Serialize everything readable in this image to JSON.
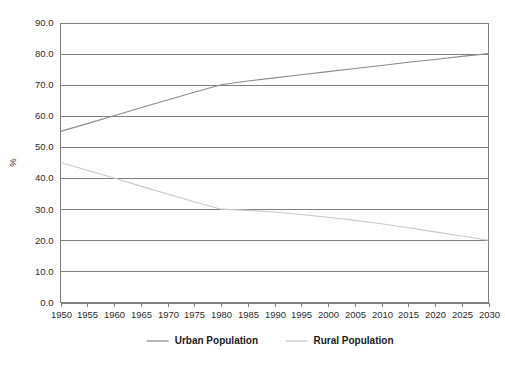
{
  "chart_data": {
    "type": "line",
    "title": "",
    "xlabel": "",
    "ylabel": "%",
    "xlim": [
      1950,
      2030
    ],
    "ylim": [
      0,
      90
    ],
    "ytick_step": 10,
    "ytick_labels": [
      "0.0",
      "10.0",
      "20.0",
      "30.0",
      "40.0",
      "50.0",
      "60.0",
      "70.0",
      "80.0",
      "90.0"
    ],
    "ytick_values": [
      0,
      10,
      20,
      30,
      40,
      50,
      60,
      70,
      80,
      90
    ],
    "xtick_labels": [
      "1950",
      "1955",
      "1960",
      "1965",
      "1970",
      "1975",
      "1980",
      "1985",
      "1990",
      "1995",
      "2000",
      "2005",
      "2010",
      "2015",
      "2020",
      "2025",
      "2030"
    ],
    "x": [
      1950,
      1955,
      1960,
      1965,
      1970,
      1975,
      1980,
      1985,
      1990,
      1995,
      2000,
      2005,
      2010,
      2015,
      2020,
      2025,
      2030
    ],
    "grid": "horizontal",
    "legend_position": "bottom-center",
    "series": [
      {
        "name": "Urban Population",
        "color": "#8c8c8c",
        "values": [
          55.0,
          57.5,
          60.0,
          62.6,
          65.1,
          67.6,
          70.0,
          71.2,
          72.2,
          73.2,
          74.2,
          75.2,
          76.2,
          77.2,
          78.1,
          79.1,
          80.0
        ]
      },
      {
        "name": "Rural Population",
        "color": "#c9c9c9",
        "values": [
          45.0,
          42.5,
          40.0,
          37.4,
          34.9,
          32.4,
          30.0,
          29.6,
          29.1,
          28.3,
          27.4,
          26.4,
          25.3,
          24.0,
          22.7,
          21.4,
          20.0
        ]
      }
    ]
  },
  "legend": {
    "entries": [
      {
        "label": "Urban Population",
        "color": "#8c8c8c"
      },
      {
        "label": "Rural Population",
        "color": "#c9c9c9"
      }
    ]
  },
  "axes": {
    "y_axis_title": "%"
  },
  "colors": {
    "grid": "#808080",
    "frame": "#808080",
    "text": "#2b2b2b",
    "legend_text": "#1a1a1a",
    "background": "#ffffff"
  }
}
